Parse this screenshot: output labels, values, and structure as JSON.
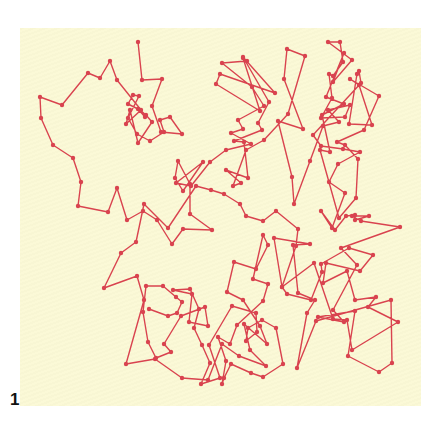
{
  "figure": {
    "label": "1",
    "background": "#fbf9d6",
    "line_color": "#d9434f"
  },
  "path_points": [
    [
      40,
      97
    ],
    [
      41,
      118
    ],
    [
      53,
      145
    ],
    [
      73,
      158
    ],
    [
      81,
      182
    ],
    [
      78,
      206
    ],
    [
      108,
      212
    ],
    [
      125,
      228
    ],
    [
      143,
      211
    ],
    [
      157,
      220
    ],
    [
      173,
      242
    ],
    [
      183,
      229
    ],
    [
      212,
      230
    ],
    [
      190,
      214
    ],
    [
      190,
      184
    ],
    [
      210,
      162
    ],
    [
      224,
      153
    ],
    [
      251,
      144
    ],
    [
      232,
      167
    ],
    [
      241,
      183
    ],
    [
      246,
      164
    ],
    [
      240,
      152
    ],
    [
      228,
      171
    ],
    [
      234,
      134
    ],
    [
      258,
      103
    ],
    [
      272,
      87
    ],
    [
      304,
      94
    ],
    [
      303,
      82
    ],
    [
      305,
      61
    ],
    [
      320,
      52
    ],
    [
      351,
      62
    ],
    [
      322,
      122
    ],
    [
      302,
      145
    ],
    [
      291,
      185
    ],
    [
      275,
      200
    ],
    [
      292,
      180
    ],
    [
      320,
      169
    ],
    [
      350,
      168
    ],
    [
      363,
      192
    ],
    [
      342,
      212
    ],
    [
      323,
      258
    ],
    [
      342,
      289
    ],
    [
      360,
      330
    ],
    [
      333,
      348
    ],
    [
      370,
      332
    ],
    [
      402,
      327
    ],
    [
      385,
      319
    ],
    [
      372,
      336
    ],
    [
      363,
      352
    ],
    [
      381,
      365
    ],
    [
      354,
      375
    ],
    [
      314,
      330
    ],
    [
      318,
      316
    ],
    [
      333,
      317
    ],
    [
      356,
      306
    ],
    [
      345,
      280
    ],
    [
      307,
      257
    ],
    [
      294,
      235
    ],
    [
      319,
      285
    ],
    [
      337,
      294
    ],
    [
      360,
      298
    ],
    [
      371,
      245
    ],
    [
      351,
      236
    ],
    [
      328,
      253
    ],
    [
      351,
      292
    ],
    [
      322,
      245
    ],
    [
      345,
      193
    ],
    [
      310,
      160
    ],
    [
      327,
      134
    ],
    [
      349,
      111
    ],
    [
      336,
      103
    ],
    [
      318,
      106
    ],
    [
      319,
      96
    ],
    [
      352,
      76
    ],
    [
      341,
      103
    ],
    [
      332,
      87
    ],
    [
      345,
      72
    ],
    [
      332,
      44
    ],
    [
      326,
      42
    ]
  ],
  "path_points_2": [
    [
      306,
      92
    ],
    [
      288,
      79
    ],
    [
      286,
      69
    ],
    [
      303,
      77
    ],
    [
      314,
      71
    ],
    [
      328,
      47
    ],
    [
      343,
      42
    ],
    [
      352,
      60
    ],
    [
      333,
      83
    ],
    [
      345,
      45
    ]
  ]
}
